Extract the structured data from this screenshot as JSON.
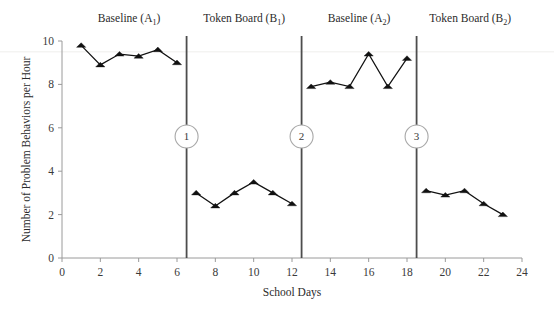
{
  "chart_data": {
    "type": "line",
    "title": "",
    "xlabel": "School Days",
    "ylabel": "Number of Problem Behaviors per Hour",
    "xlim": [
      0,
      24
    ],
    "ylim": [
      0,
      10
    ],
    "x_ticks": [
      0,
      2,
      4,
      6,
      8,
      10,
      12,
      14,
      16,
      18,
      20,
      22,
      24
    ],
    "y_ticks": [
      0,
      2,
      4,
      6,
      8,
      10
    ],
    "grid": false,
    "legend": "none",
    "marker": "filled-triangle",
    "series": [
      {
        "name": "Baseline (A1)",
        "x": [
          1,
          2,
          3,
          4,
          5,
          6
        ],
        "values": [
          9.8,
          8.9,
          9.4,
          9.3,
          9.6,
          9.0
        ]
      },
      {
        "name": "Token Board (B1)",
        "x": [
          7,
          8,
          9,
          10,
          11,
          12
        ],
        "values": [
          3.0,
          2.4,
          3.0,
          3.5,
          3.0,
          2.5
        ]
      },
      {
        "name": "Baseline (A2)",
        "x": [
          13,
          14,
          15,
          16,
          17,
          18
        ],
        "values": [
          7.9,
          8.1,
          7.9,
          9.4,
          7.9,
          9.2
        ]
      },
      {
        "name": "Token Board (B2)",
        "x": [
          19,
          20,
          21,
          22,
          23
        ],
        "values": [
          3.1,
          2.9,
          3.1,
          2.5,
          2.0
        ]
      }
    ],
    "phases": [
      {
        "label": "Baseline",
        "condition": "A",
        "subscript": "1",
        "label_x": 3.5
      },
      {
        "label": "Token Board",
        "condition": "B",
        "subscript": "1",
        "label_x": 9.5
      },
      {
        "label": "Baseline",
        "condition": "A",
        "subscript": "2",
        "label_x": 15.5
      },
      {
        "label": "Token Board",
        "condition": "B",
        "subscript": "2",
        "label_x": 21.3
      }
    ],
    "phase_change_lines": [
      {
        "x": 6.5,
        "marker": "1"
      },
      {
        "x": 12.5,
        "marker": "2"
      },
      {
        "x": 18.5,
        "marker": "3"
      }
    ],
    "phase_marker_y": 5.6,
    "colors": {
      "data": "#111111",
      "axis": "#9a9a9a",
      "phase_line": "#4d4d4d",
      "text": "#2b2b2b",
      "background": "#ffffff"
    }
  }
}
